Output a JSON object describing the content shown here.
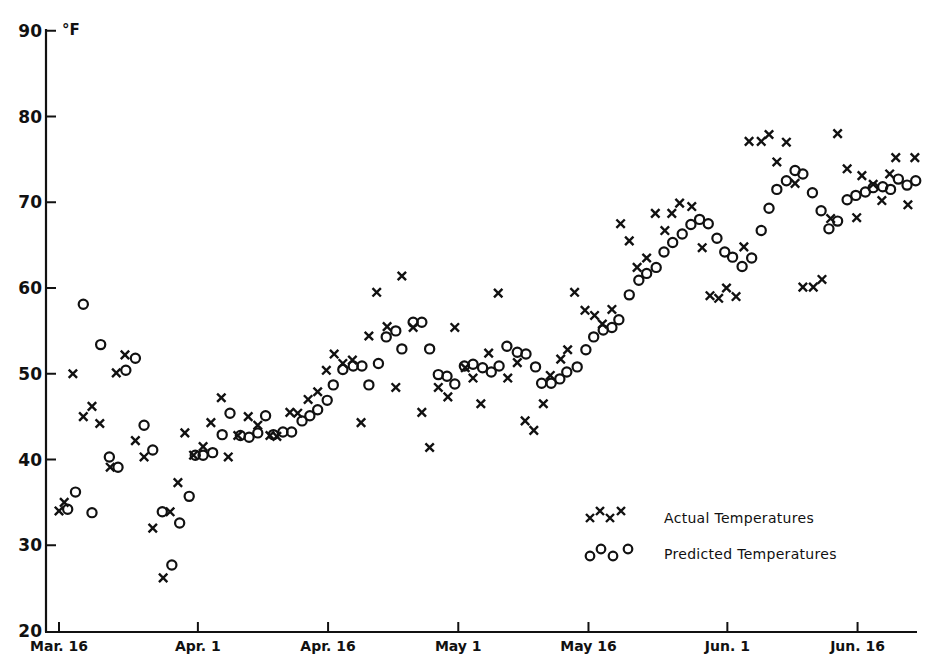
{
  "chart_data": {
    "type": "scatter",
    "title": "",
    "xlabel": "",
    "ylabel": "°F",
    "y_unit_label": "°F",
    "ylim": [
      20,
      90
    ],
    "yticks": [
      20,
      30,
      40,
      50,
      60,
      70,
      80,
      90
    ],
    "x_unit": "days since Mar. 16",
    "xlim": [
      0,
      100
    ],
    "xticks": [
      {
        "day": 0,
        "label": "Mar. 16"
      },
      {
        "day": 16,
        "label": "Apr. 1"
      },
      {
        "day": 31,
        "label": "Apr. 16"
      },
      {
        "day": 46,
        "label": "May 1"
      },
      {
        "day": 61,
        "label": "May 16"
      },
      {
        "day": 77,
        "label": "Jun. 1"
      },
      {
        "day": 92,
        "label": "Jun. 16"
      }
    ],
    "grid": false,
    "legend_position": "lower right",
    "series": [
      {
        "name": "Actual Temperatures",
        "marker": "x",
        "points": [
          [
            0,
            34
          ],
          [
            0.6,
            35
          ],
          [
            1.6,
            50
          ],
          [
            2.8,
            45
          ],
          [
            3.8,
            46.2
          ],
          [
            4.7,
            44.2
          ],
          [
            5.9,
            39.1
          ],
          [
            6.6,
            50.1
          ],
          [
            7.6,
            52.2
          ],
          [
            8.8,
            42.2
          ],
          [
            9.8,
            40.3
          ],
          [
            10.8,
            32
          ],
          [
            12,
            26.2
          ],
          [
            12.8,
            33.9
          ],
          [
            13.7,
            37.3
          ],
          [
            14.5,
            43.1
          ],
          [
            15.5,
            40.5
          ],
          [
            16.6,
            41.5
          ],
          [
            17.5,
            44.3
          ],
          [
            18.7,
            47.2
          ],
          [
            19.5,
            40.3
          ],
          [
            20.6,
            42.8
          ],
          [
            21.8,
            45
          ],
          [
            22.9,
            44
          ],
          [
            24.3,
            42.8
          ],
          [
            25.1,
            42.7
          ],
          [
            26.6,
            45.5
          ],
          [
            27.5,
            45.4
          ],
          [
            28.7,
            47
          ],
          [
            29.8,
            47.9
          ],
          [
            30.8,
            50.4
          ],
          [
            31.7,
            52.3
          ],
          [
            32.7,
            51.2
          ],
          [
            33.8,
            51.6
          ],
          [
            34.8,
            44.3
          ],
          [
            35.7,
            54.4
          ],
          [
            36.6,
            59.5
          ],
          [
            37.8,
            55.5
          ],
          [
            38.8,
            48.4
          ],
          [
            39.5,
            61.4
          ],
          [
            40.8,
            55.4
          ],
          [
            41.8,
            45.5
          ],
          [
            42.7,
            41.4
          ],
          [
            43.7,
            48.4
          ],
          [
            44.8,
            47.3
          ],
          [
            45.6,
            55.4
          ],
          [
            46.8,
            50.7
          ],
          [
            47.7,
            49.5
          ],
          [
            48.6,
            46.5
          ],
          [
            49.5,
            52.4
          ],
          [
            50.6,
            59.4
          ],
          [
            51.7,
            49.5
          ],
          [
            52.8,
            51.3
          ],
          [
            53.7,
            44.5
          ],
          [
            54.7,
            43.4
          ],
          [
            55.8,
            46.5
          ],
          [
            56.6,
            49.8
          ],
          [
            57.8,
            51.7
          ],
          [
            58.6,
            52.8
          ],
          [
            59.4,
            59.5
          ],
          [
            60.6,
            57.4
          ],
          [
            61.7,
            56.8
          ],
          [
            62.6,
            55.8
          ],
          [
            63.7,
            57.5
          ],
          [
            64.7,
            67.5
          ],
          [
            65.7,
            65.5
          ],
          [
            66.6,
            62.4
          ],
          [
            67.7,
            63.5
          ],
          [
            68.7,
            68.7
          ],
          [
            69.8,
            66.7
          ],
          [
            70.6,
            68.7
          ],
          [
            71.5,
            69.9
          ],
          [
            72.9,
            69.5
          ],
          [
            74.1,
            64.7
          ],
          [
            75,
            59.1
          ],
          [
            76,
            58.8
          ],
          [
            76.9,
            60
          ],
          [
            78,
            59
          ],
          [
            78.9,
            64.8
          ],
          [
            79.5,
            77.1
          ],
          [
            80.9,
            77.1
          ],
          [
            81.8,
            77.9
          ],
          [
            82.7,
            74.7
          ],
          [
            83.8,
            77
          ],
          [
            84.8,
            72.2
          ],
          [
            85.7,
            60.1
          ],
          [
            86.9,
            60.1
          ],
          [
            87.9,
            61
          ],
          [
            88.9,
            68.1
          ],
          [
            89.7,
            78
          ],
          [
            90.8,
            73.9
          ],
          [
            91.9,
            68.2
          ],
          [
            92.5,
            73.1
          ],
          [
            93.8,
            72.1
          ],
          [
            94.8,
            70.2
          ],
          [
            95.7,
            73.3
          ],
          [
            96.4,
            75.2
          ],
          [
            97.8,
            69.7
          ],
          [
            98.6,
            75.2
          ]
        ]
      },
      {
        "name": "Predicted Temperatures",
        "marker": "o",
        "points": [
          [
            1.0,
            34.2
          ],
          [
            1.9,
            36.2
          ],
          [
            2.8,
            58.1
          ],
          [
            3.8,
            33.8
          ],
          [
            4.8,
            53.4
          ],
          [
            5.8,
            40.3
          ],
          [
            6.8,
            39.1
          ],
          [
            7.7,
            50.4
          ],
          [
            8.8,
            51.8
          ],
          [
            9.8,
            44
          ],
          [
            10.8,
            41.1
          ],
          [
            11.9,
            33.9
          ],
          [
            13,
            27.7
          ],
          [
            13.9,
            32.6
          ],
          [
            15,
            35.7
          ],
          [
            15.7,
            40.5
          ],
          [
            16.6,
            40.5
          ],
          [
            17.7,
            40.8
          ],
          [
            18.8,
            42.9
          ],
          [
            19.7,
            45.4
          ],
          [
            20.9,
            42.8
          ],
          [
            21.9,
            42.6
          ],
          [
            22.9,
            43.1
          ],
          [
            23.8,
            45.1
          ],
          [
            24.7,
            42.9
          ],
          [
            25.8,
            43.2
          ],
          [
            26.8,
            43.2
          ],
          [
            28,
            44.5
          ],
          [
            28.9,
            45.1
          ],
          [
            29.8,
            45.8
          ],
          [
            30.9,
            46.9
          ],
          [
            31.6,
            48.7
          ],
          [
            32.7,
            50.5
          ],
          [
            33.9,
            50.9
          ],
          [
            34.9,
            50.9
          ],
          [
            35.7,
            48.7
          ],
          [
            36.8,
            51.2
          ],
          [
            37.7,
            54.3
          ],
          [
            38.8,
            55
          ],
          [
            39.5,
            52.9
          ],
          [
            40.8,
            56
          ],
          [
            41.8,
            56
          ],
          [
            42.7,
            52.9
          ],
          [
            43.7,
            49.9
          ],
          [
            44.7,
            49.7
          ],
          [
            45.6,
            48.8
          ],
          [
            46.7,
            50.9
          ],
          [
            47.7,
            51.1
          ],
          [
            48.8,
            50.7
          ],
          [
            49.8,
            50.2
          ],
          [
            50.7,
            50.9
          ],
          [
            51.6,
            53.2
          ],
          [
            52.8,
            52.5
          ],
          [
            53.8,
            52.3
          ],
          [
            54.9,
            50.8
          ],
          [
            55.6,
            48.9
          ],
          [
            56.7,
            48.9
          ],
          [
            57.7,
            49.4
          ],
          [
            58.5,
            50.2
          ],
          [
            59.7,
            50.8
          ],
          [
            60.7,
            52.8
          ],
          [
            61.6,
            54.3
          ],
          [
            62.7,
            55.1
          ],
          [
            63.7,
            55.4
          ],
          [
            64.5,
            56.3
          ],
          [
            65.7,
            59.2
          ],
          [
            66.8,
            60.9
          ],
          [
            67.7,
            61.7
          ],
          [
            68.8,
            62.4
          ],
          [
            69.7,
            64.2
          ],
          [
            70.7,
            65.3
          ],
          [
            71.8,
            66.3
          ],
          [
            72.8,
            67.4
          ],
          [
            73.8,
            68
          ],
          [
            74.8,
            67.5
          ],
          [
            75.8,
            65.8
          ],
          [
            76.7,
            64.2
          ],
          [
            77.6,
            63.6
          ],
          [
            78.7,
            62.5
          ],
          [
            79.8,
            63.5
          ],
          [
            80.9,
            66.7
          ],
          [
            81.8,
            69.3
          ],
          [
            82.7,
            71.5
          ],
          [
            83.8,
            72.5
          ],
          [
            84.8,
            73.7
          ],
          [
            85.7,
            73.3
          ],
          [
            86.8,
            71.1
          ],
          [
            87.8,
            69
          ],
          [
            88.7,
            66.9
          ],
          [
            89.7,
            67.8
          ],
          [
            90.8,
            70.3
          ],
          [
            91.8,
            70.8
          ],
          [
            92.9,
            71.2
          ],
          [
            93.8,
            71.7
          ],
          [
            94.9,
            71.8
          ],
          [
            95.8,
            71.5
          ],
          [
            96.7,
            72.7
          ],
          [
            97.7,
            72
          ],
          [
            98.7,
            72.5
          ]
        ]
      }
    ]
  },
  "axes": {
    "y_unit": "°F",
    "y_labels": [
      "20",
      "30",
      "40",
      "50",
      "60",
      "70",
      "80",
      "90"
    ],
    "x_labels": [
      "Mar. 16",
      "Apr. 1",
      "Apr. 16",
      "May 1",
      "May 16",
      "Jun. 1",
      "Jun. 16"
    ]
  },
  "legend": {
    "items": [
      {
        "label": "Actual Temperatures",
        "marker": "x-marker-icon"
      },
      {
        "label": "Predicted Temperatures",
        "marker": "o-marker-icon"
      }
    ]
  }
}
